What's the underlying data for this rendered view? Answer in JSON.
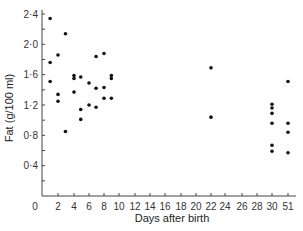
{
  "chart_data": {
    "type": "scatter",
    "title": "",
    "xlabel": "Days after birth",
    "ylabel": "Fat (g/100 ml)",
    "ylim": [
      0,
      2.4
    ],
    "grid": false,
    "legend": null,
    "y_ticks": [
      {
        "value": 0.4,
        "label": "0·4"
      },
      {
        "value": 0.8,
        "label": "0·8"
      },
      {
        "value": 1.2,
        "label": "1·2"
      },
      {
        "value": 1.6,
        "label": "1·6"
      },
      {
        "value": 2.0,
        "label": "2·0"
      },
      {
        "value": 2.4,
        "label": "2·4"
      }
    ],
    "x_ticks": [
      {
        "px": 58,
        "label": "2"
      },
      {
        "px": 74,
        "label": "4"
      },
      {
        "px": 89,
        "label": "6"
      },
      {
        "px": 104,
        "label": "8"
      },
      {
        "px": 119,
        "label": "10"
      },
      {
        "px": 135,
        "label": "12"
      },
      {
        "px": 150,
        "label": "14"
      },
      {
        "px": 165,
        "label": "16"
      },
      {
        "px": 181,
        "label": "18"
      },
      {
        "px": 196,
        "label": "20"
      },
      {
        "px": 211,
        "label": "22"
      },
      {
        "px": 225,
        "label": "24"
      },
      {
        "px": 242,
        "label": "26"
      },
      {
        "px": 257,
        "label": "28"
      },
      {
        "px": 272,
        "label": "30"
      },
      {
        "px": 288,
        "label": "51"
      }
    ],
    "origin_label": "0",
    "points": [
      {
        "day": 1,
        "fat": 2.34
      },
      {
        "day": 1,
        "fat": 1.76
      },
      {
        "day": 1,
        "fat": 1.51
      },
      {
        "day": 2,
        "fat": 1.86
      },
      {
        "day": 2,
        "fat": 1.34
      },
      {
        "day": 2,
        "fat": 1.25
      },
      {
        "day": 3,
        "fat": 2.14
      },
      {
        "day": 3,
        "fat": 0.85
      },
      {
        "day": 4,
        "fat": 1.59
      },
      {
        "day": 4,
        "fat": 1.55
      },
      {
        "day": 4,
        "fat": 1.37
      },
      {
        "day": 5,
        "fat": 1.57
      },
      {
        "day": 5,
        "fat": 1.14
      },
      {
        "day": 5,
        "fat": 1.01
      },
      {
        "day": 6,
        "fat": 1.49
      },
      {
        "day": 6,
        "fat": 1.2
      },
      {
        "day": 7,
        "fat": 1.84
      },
      {
        "day": 7,
        "fat": 1.42
      },
      {
        "day": 7,
        "fat": 1.17
      },
      {
        "day": 8,
        "fat": 1.88
      },
      {
        "day": 8,
        "fat": 1.43
      },
      {
        "day": 8,
        "fat": 1.29
      },
      {
        "day": 9,
        "fat": 1.59
      },
      {
        "day": 9,
        "fat": 1.55
      },
      {
        "day": 9,
        "fat": 1.29
      },
      {
        "day": 22,
        "fat": 1.69
      },
      {
        "day": 22,
        "fat": 1.04
      },
      {
        "day": 30,
        "fat": 1.21
      },
      {
        "day": 30,
        "fat": 1.16
      },
      {
        "day": 30,
        "fat": 1.09
      },
      {
        "day": 30,
        "fat": 0.96
      },
      {
        "day": 30,
        "fat": 0.67
      },
      {
        "day": 30,
        "fat": 0.59
      },
      {
        "day": 51,
        "fat": 1.51
      },
      {
        "day": 51,
        "fat": 0.96
      },
      {
        "day": 51,
        "fat": 0.84
      },
      {
        "day": 51,
        "fat": 0.57
      }
    ]
  },
  "colors": {
    "axis": "#444444",
    "point": "#111111",
    "text": "#333333"
  }
}
